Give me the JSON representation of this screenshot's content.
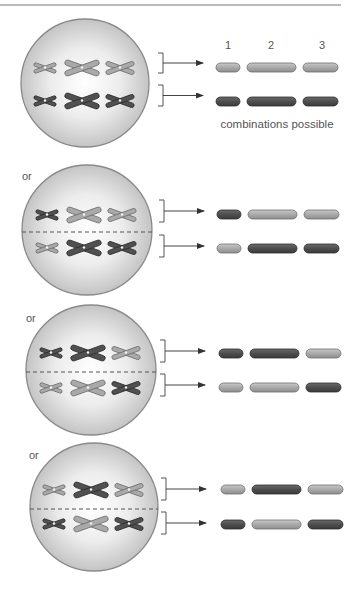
{
  "figure": {
    "top_rule": true,
    "column_numbers": [
      "1",
      "2",
      "3"
    ],
    "caption": "combinations possible",
    "separator_label": "or"
  },
  "colors": {
    "light_chromosome": "#a9a9a9",
    "light_outline": "#707070",
    "dark_chromosome": "#505050",
    "dark_outline": "#2e2e2e",
    "cell_edge": "#8a8a8a",
    "cell_center": "#ffffff",
    "cell_rim": "#c4c4c4",
    "text": "#555555"
  },
  "cells": [
    {
      "label": "",
      "has_divider": false,
      "top_row": [
        "light",
        "light",
        "light"
      ],
      "bottom_row": [
        "dark",
        "dark",
        "dark"
      ]
    },
    {
      "label": "or",
      "has_divider": true,
      "top_row": [
        "dark",
        "light",
        "light"
      ],
      "bottom_row": [
        "light",
        "dark",
        "dark"
      ]
    },
    {
      "label": "or",
      "has_divider": true,
      "top_row": [
        "dark",
        "dark",
        "light"
      ],
      "bottom_row": [
        "light",
        "light",
        "dark"
      ]
    },
    {
      "label": "or",
      "has_divider": true,
      "top_row": [
        "light",
        "dark",
        "light"
      ],
      "bottom_row": [
        "dark",
        "light",
        "dark"
      ]
    }
  ]
}
